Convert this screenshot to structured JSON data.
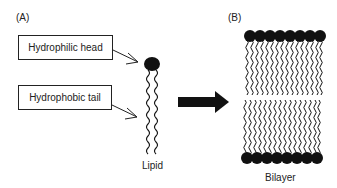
{
  "panels": {
    "a": {
      "label": "(A)"
    },
    "b": {
      "label": "(B)"
    }
  },
  "callouts": [
    {
      "text": "Hydrophilic head",
      "points_to": "lipid-head"
    },
    {
      "text": "Hydrophobic tail",
      "points_to": "lipid-tail"
    }
  ],
  "lipid": {
    "caption": "Lipid"
  },
  "bilayer": {
    "caption": "Bilayer",
    "lipids_per_leaflet": 8
  },
  "colors": {
    "ink": "#111111",
    "background": "#ffffff"
  }
}
